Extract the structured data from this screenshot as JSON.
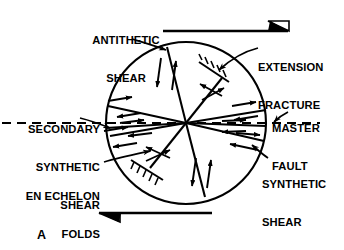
{
  "figure": {
    "panel_letter": "A",
    "ink_color": "#000000",
    "background_color": "#ffffff"
  },
  "labels": [
    {
      "id": "antithetic-shear",
      "text": "ANTITHETIC\nSHEAR",
      "lines": [
        "ANTITHETIC",
        "SHEAR"
      ],
      "align": "center",
      "x": 78,
      "y": 9,
      "w": 96
    },
    {
      "id": "extension-fracture",
      "text": "EXTENSION\nFRACTURE",
      "lines": [
        "EXTENSION",
        "FRACTURE"
      ],
      "align": "left",
      "x": 258,
      "y": 36,
      "w": 86
    },
    {
      "id": "master-fault",
      "text": "MASTER\nFAULT",
      "lines": [
        "MASTER",
        "FAULT"
      ],
      "align": "left",
      "x": 272,
      "y": 97,
      "w": 72
    },
    {
      "id": "secondary-synthetic-shear",
      "text": "SECONDARY\nSYNTHETIC\nSHEAR",
      "lines": [
        "SECONDARY",
        "SYNTHETIC",
        "SHEAR"
      ],
      "align": "right",
      "x": 4,
      "y": 98,
      "w": 96
    },
    {
      "id": "synthetic-shear",
      "text": "SYNTHETIC\nSHEAR",
      "lines": [
        "SYNTHETIC",
        "SHEAR"
      ],
      "align": "left",
      "x": 262,
      "y": 153,
      "w": 82
    },
    {
      "id": "en-echelon-folds",
      "text": "EN ECHELON\nFOLDS",
      "lines": [
        "EN ECHELON",
        "FOLDS"
      ],
      "align": "right",
      "x": 2,
      "y": 165,
      "w": 98
    }
  ],
  "strain_ellipse": {
    "center_x": 186,
    "center_y": 123,
    "radius_x": 80,
    "radius_y": 81,
    "stroke_width": 2.0
  },
  "shear_couple": {
    "top_arrow": {
      "direction": "right",
      "x1": 163,
      "x2": 288,
      "y": 30
    },
    "bottom_arrow": {
      "direction": "left",
      "x1": 99,
      "x2": 212,
      "y": 213
    }
  },
  "master_fault_trace": {
    "style": "dashed",
    "x1": 2,
    "x2": 320,
    "y": 123
  },
  "internal_structures": [
    {
      "name": "synthetic-shear-upper",
      "type": "synthetic-shear"
    },
    {
      "name": "synthetic-shear-lower",
      "type": "synthetic-shear"
    },
    {
      "name": "secondary-synthetic-shear-line",
      "type": "secondary-synthetic-shear"
    },
    {
      "name": "antithetic-shear-upper",
      "type": "antithetic-shear"
    },
    {
      "name": "antithetic-shear-lower",
      "type": "antithetic-shear"
    },
    {
      "name": "extension-fracture-upper",
      "type": "extension-fracture"
    },
    {
      "name": "extension-fracture-lower",
      "type": "extension-fracture"
    },
    {
      "name": "en-echelon-fold-upper",
      "type": "fold-trace"
    },
    {
      "name": "en-echelon-fold-lower",
      "type": "fold-trace"
    }
  ]
}
